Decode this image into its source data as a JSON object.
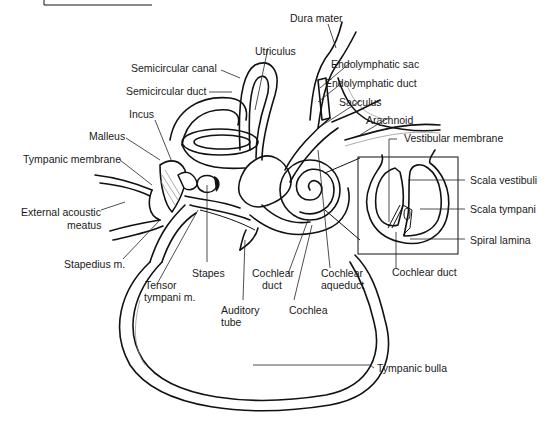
{
  "figure": {
    "inset": "Cross-section of cochlear turn"
  },
  "labels": {
    "dura_mater": "Dura mater",
    "utriculus": "Utriculus",
    "semicircular_canal": "Semicircular canal",
    "semicircular_duct": "Semicircular duct",
    "endolymphatic_sac": "Endolymphatic sac",
    "endolymphatic_duct": "Endolymphatic duct",
    "sacculus": "Sacculus",
    "arachnoid": "Arachnoid",
    "incus": "Incus",
    "malleus": "Malleus",
    "tympanic_membrane": "Tympanic membrane",
    "external_acoustic_1": "External acoustic",
    "external_acoustic_2": "meatus",
    "stapedius": "Stapedius m.",
    "tensor_1": "Tensor",
    "tensor_2": "tympani m.",
    "stapes": "Stapes",
    "auditory_1": "Auditory",
    "auditory_2": "tube",
    "cochlear_duct_main_1": "Cochlear",
    "cochlear_duct_main_2": "duct",
    "cochlea": "Cochlea",
    "cochlear_aqueduct_1": "Cochlear",
    "cochlear_aqueduct_2": "aqueduct",
    "vestibular_membrane": "Vestibular membrane",
    "scala_vestibuli": "Scala vestibuli",
    "scala_tympani": "Scala tympani",
    "spiral_lamina": "Spiral lamina",
    "cochlear_duct_inset": "Cochlear duct",
    "tympanic_bulla": "Tympanic bulla"
  }
}
